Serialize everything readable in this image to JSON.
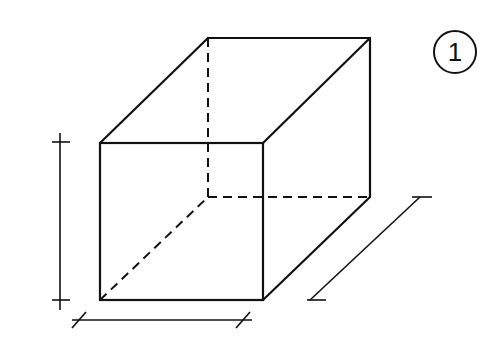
{
  "figure": {
    "label": "1",
    "colors": {
      "line": "#111111",
      "background": "#ffffff"
    }
  }
}
